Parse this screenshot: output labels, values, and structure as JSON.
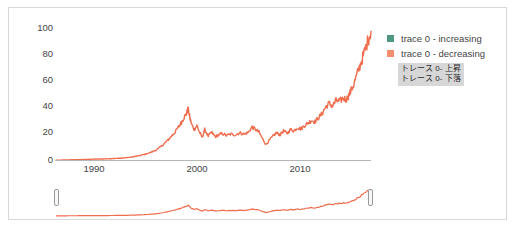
{
  "chart_data": {
    "type": "line",
    "title": "",
    "xlabel": "",
    "ylabel": "",
    "xlim": [
      1985,
      2021
    ],
    "ylim": [
      0,
      100
    ],
    "grid": false,
    "legend_position": "top-right",
    "yticks": [
      0,
      20,
      40,
      60,
      80,
      100
    ],
    "xticks": [
      1990,
      2000,
      2010
    ],
    "series": [
      {
        "name": "trace 0 - decreasing",
        "color": "#EF6C4D",
        "x": [
          1985.0,
          1985.6,
          1986.2,
          1986.8,
          1987.4,
          1988.0,
          1988.6,
          1989.2,
          1989.8,
          1990.4,
          1991.0,
          1991.6,
          1992.2,
          1992.8,
          1993.4,
          1994.0,
          1994.6,
          1995.2,
          1995.8,
          1996.4,
          1997.0,
          1997.4,
          1997.8,
          1998.2,
          1998.6,
          1999.0,
          1999.3,
          1999.6,
          1999.9,
          2000.1,
          2000.3,
          2000.5,
          2000.8,
          2001.1,
          2001.4,
          2001.7,
          2002.0,
          2002.4,
          2002.8,
          2003.2,
          2003.6,
          2004.0,
          2004.5,
          2005.0,
          2005.5,
          2006.0,
          2006.5,
          2007.0,
          2007.4,
          2007.8,
          2008.2,
          2008.6,
          2009.0,
          2009.4,
          2009.8,
          2010.2,
          2010.6,
          2011.0,
          2011.4,
          2011.8,
          2012.2,
          2012.6,
          2013.0,
          2013.4,
          2013.8,
          2014.2,
          2014.6,
          2015.0,
          2015.4,
          2015.8,
          2016.2,
          2016.6,
          2017.0,
          2017.4,
          2017.8,
          2018.2,
          2018.6,
          2019.0,
          2019.4,
          2019.8,
          2020.2,
          2020.6,
          2021.0
        ],
        "y": [
          0.6,
          0.7,
          0.8,
          0.9,
          1.0,
          1.1,
          1.2,
          1.4,
          1.5,
          1.6,
          1.7,
          1.9,
          2.1,
          2.4,
          2.8,
          3.4,
          4.2,
          5.2,
          6.5,
          8.2,
          11.0,
          13.5,
          16.0,
          19.0,
          22.0,
          26.0,
          29.0,
          33.0,
          36.0,
          40.0,
          33.0,
          28.0,
          24.0,
          27.0,
          22.0,
          18.0,
          24.0,
          19.0,
          22.0,
          18.5,
          20.0,
          21.0,
          19.5,
          20.5,
          20.0,
          21.5,
          20.5,
          22.0,
          26.0,
          24.0,
          22.0,
          17.0,
          12.5,
          16.0,
          19.0,
          21.5,
          20.0,
          23.0,
          21.0,
          24.0,
          23.0,
          25.5,
          24.5,
          27.0,
          29.0,
          31.0,
          30.0,
          33.0,
          36.0,
          41.0,
          44.0,
          42.0,
          46.0,
          45.5,
          48.0,
          47.0,
          52.0,
          58.0,
          66.0,
          74.0,
          82.0,
          91.0,
          99.0
        ]
      }
    ],
    "legend_entries": [
      {
        "label": "trace 0 - increasing",
        "color": "#3D9970"
      },
      {
        "label": "trace 0 - decreasing",
        "color": "#F08160"
      }
    ]
  },
  "legend": {
    "items": [
      {
        "label": "trace 0 - increasing",
        "color": "#4E9A80"
      },
      {
        "label": "trace 0 - decreasing",
        "color": "#F28E6E"
      }
    ]
  },
  "translation_overlay": {
    "lines": [
      "トレース 0- 上昇",
      "トレース 0- 下落"
    ]
  },
  "axes": {
    "y_ticks": [
      "100",
      "80",
      "60",
      "40",
      "20",
      "0"
    ],
    "x_ticks": [
      "1990",
      "2000",
      "2010"
    ]
  },
  "rangeslider": {
    "left_handle_label": "range-start-handle",
    "right_handle_label": "range-end-handle"
  },
  "colors": {
    "line": "#EF6C4D",
    "axis": "#b6b6b6",
    "tick_text": "#444444",
    "border": "#d9d9d9"
  }
}
